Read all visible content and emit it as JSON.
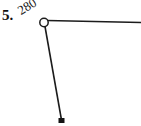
{
  "figure": {
    "problem_number": "5.",
    "angle_measure": "280°",
    "background_color": "#ffffff",
    "stroke_color": "#1c1c1c",
    "text_color": "#111111"
  },
  "geometry": {
    "vertex_marker": {
      "shape": "open-circle",
      "cx": 44,
      "cy": 22.5,
      "r": 4.2,
      "fill": "#ffffff",
      "stroke": "#1c1c1c"
    },
    "rays": [
      {
        "name": "horizontal-ray",
        "x1": 47,
        "y1": 20.5,
        "x2": 141,
        "y2": 22.5
      },
      {
        "name": "slanted-ray",
        "x1": 45,
        "y1": 26.5,
        "x2": 61.5,
        "y2": 120
      }
    ],
    "endpoint_marker": {
      "shape": "filled-square",
      "x": 58.5,
      "y": 118,
      "width": 6,
      "height": 5,
      "fill": "#141414"
    }
  }
}
